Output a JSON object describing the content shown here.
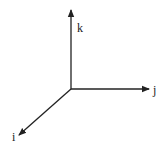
{
  "diagram": {
    "type": "3d-coordinate-axes",
    "origin": [
      71,
      89
    ],
    "axes": [
      {
        "name": "k",
        "label": "k",
        "direction": "up",
        "end": [
          71,
          9
        ],
        "label_pos": [
          77,
          32
        ]
      },
      {
        "name": "j",
        "label": "j",
        "direction": "right",
        "end": [
          150,
          89
        ],
        "label_pos": [
          153,
          94
        ]
      },
      {
        "name": "i",
        "label": "i",
        "direction": "down-left",
        "end": [
          18,
          136
        ],
        "label_pos": [
          12,
          141
        ]
      }
    ],
    "colors": {
      "stroke": "#222222",
      "background": "#ffffff"
    }
  }
}
